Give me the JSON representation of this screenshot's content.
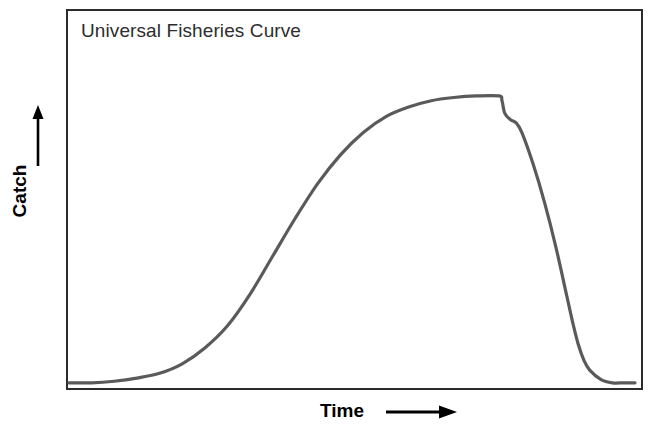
{
  "chart_data": {
    "type": "line",
    "title": "Universal Fisheries Curve",
    "xlabel": "Time",
    "ylabel": "Catch",
    "xlabel_arrow": "right-arrow",
    "ylabel_arrow": "up-arrow",
    "grid": false,
    "legend": null,
    "axis_ticks": false,
    "tick_labels": [],
    "xlim": [
      0,
      100
    ],
    "ylim": [
      0,
      100
    ],
    "series": [
      {
        "name": "Universal Fisheries Curve",
        "color": "#5a5a5a",
        "linewidth": 3,
        "x": [
          0,
          4,
          8,
          12,
          16,
          20,
          24,
          28,
          32,
          36,
          40,
          44,
          48,
          52,
          56,
          60,
          64,
          68,
          72,
          76,
          76.5,
          77,
          78,
          79,
          80,
          82,
          84,
          86,
          88,
          89,
          90,
          91,
          92,
          94,
          96,
          98,
          100
        ],
        "y": [
          1,
          1,
          1.5,
          2.5,
          4,
          7,
          12,
          19,
          29,
          41,
          53,
          64,
          73,
          80,
          85,
          88,
          90,
          91,
          91.5,
          91.5,
          90,
          86,
          84,
          83,
          80,
          70,
          58,
          44,
          28,
          20,
          13,
          8,
          5,
          2,
          1,
          1,
          1
        ]
      }
    ],
    "annotations": [
      {
        "text": "sigmoid growth phase",
        "x_range": [
          12,
          60
        ],
        "visible": false
      },
      {
        "text": "plateau at maximum catch",
        "x_range": [
          62,
          76
        ],
        "visible": false
      },
      {
        "text": "collapse",
        "x_range": [
          76,
          94
        ],
        "visible": false
      }
    ]
  },
  "figure": {
    "background_color": "#ffffff",
    "frame_color": "#2b2b2b",
    "title_color": "#2d2d2d",
    "axis_label_color": "#000000",
    "curve_color": "#5a5a5a"
  }
}
